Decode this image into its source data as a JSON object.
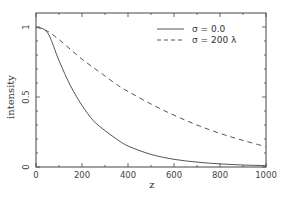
{
  "chart_data": {
    "type": "line",
    "title": "",
    "xlabel": "z",
    "ylabel": "intensity",
    "xlim": [
      0,
      1000
    ],
    "ylim": [
      0,
      1.1
    ],
    "grid": false,
    "legend_position": "upper right",
    "x_ticks": [
      0,
      200,
      400,
      600,
      800,
      1000
    ],
    "x_tick_labels": [
      "0",
      "200",
      "400",
      "600",
      "800",
      "1000"
    ],
    "y_ticks": [
      0,
      0.5,
      1
    ],
    "y_tick_labels": [
      "0",
      "0.5",
      "1"
    ],
    "x": [
      0,
      50,
      100,
      150,
      200,
      250,
      300,
      350,
      400,
      500,
      600,
      700,
      800,
      900,
      1000
    ],
    "series": [
      {
        "name": "σ = 0.0",
        "style": "solid",
        "values": [
          1.0,
          0.96,
          0.76,
          0.58,
          0.44,
          0.33,
          0.26,
          0.2,
          0.15,
          0.09,
          0.055,
          0.035,
          0.022,
          0.014,
          0.01
        ]
      },
      {
        "name": "σ = 200 λ",
        "style": "dashed",
        "values": [
          1.0,
          0.97,
          0.91,
          0.84,
          0.77,
          0.71,
          0.65,
          0.59,
          0.54,
          0.45,
          0.37,
          0.3,
          0.24,
          0.19,
          0.145
        ]
      }
    ]
  },
  "legend": {
    "items": [
      {
        "label": "σ = 0.0",
        "style": "solid"
      },
      {
        "label": "σ = 200 λ",
        "style": "dashed"
      }
    ]
  },
  "colors": {
    "line": "#555555",
    "axis": "#444444"
  }
}
